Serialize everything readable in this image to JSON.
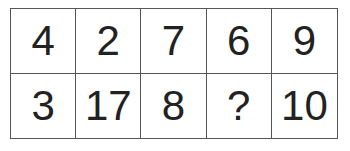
{
  "puzzle": {
    "rows": [
      [
        "4",
        "2",
        "7",
        "6",
        "9"
      ],
      [
        "3",
        "17",
        "8",
        "?",
        "10"
      ]
    ]
  }
}
